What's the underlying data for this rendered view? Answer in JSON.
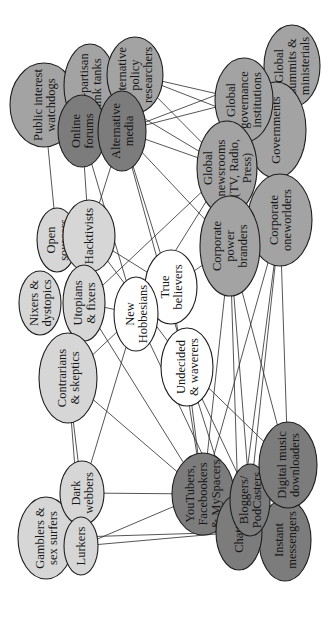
{
  "diagram": {
    "title": "",
    "orientation": "rotated-90-ccw",
    "colors": {
      "white": "#ffffff",
      "light": "#d6d6d6",
      "medium": "#a3a3a3",
      "dark": "#7c7c7c",
      "stroke": "#1e1e1e"
    },
    "nodes": [
      {
        "id": "public-interest-watchdogs",
        "lines": [
          "Public interest",
          "watchdogs"
        ],
        "cx": 44,
        "cy": 105,
        "rx": 34,
        "ry": 42,
        "shade": "medium"
      },
      {
        "id": "non-partisan-think-tanks",
        "lines": [
          "Non-partisan",
          "think tanks"
        ],
        "cx": 90,
        "cy": 86,
        "rx": 26,
        "ry": 42,
        "shade": "medium"
      },
      {
        "id": "online-forums",
        "lines": [
          "Online",
          "forums"
        ],
        "cx": 82,
        "cy": 131,
        "rx": 24,
        "ry": 36,
        "shade": "dark"
      },
      {
        "id": "alternative-policy-researchers",
        "lines": [
          "Alternative",
          "policy",
          "researchers"
        ],
        "cx": 135,
        "cy": 75,
        "rx": 28,
        "ry": 38,
        "shade": "medium"
      },
      {
        "id": "alternative-media",
        "lines": [
          "Alternative",
          "media"
        ],
        "cx": 122,
        "cy": 131,
        "rx": 24,
        "ry": 40,
        "shade": "dark"
      },
      {
        "id": "global-summits-ministerials",
        "lines": [
          "Global",
          "summits &",
          "ministerials"
        ],
        "cx": 292,
        "cy": 66,
        "rx": 28,
        "ry": 41,
        "shade": "medium"
      },
      {
        "id": "governments",
        "lines": [
          "Governments"
        ],
        "cx": 276,
        "cy": 130,
        "rx": 30,
        "ry": 48,
        "shade": "medium"
      },
      {
        "id": "global-governance-institutions",
        "lines": [
          "Global",
          "governance",
          "institutions"
        ],
        "cx": 244,
        "cy": 100,
        "rx": 29,
        "ry": 42,
        "shade": "medium"
      },
      {
        "id": "global-newsrooms",
        "lines": [
          "Global",
          "newsrooms",
          "(TV, Radio,",
          "Press)"
        ],
        "cx": 227,
        "cy": 168,
        "rx": 30,
        "ry": 47,
        "shade": "medium"
      },
      {
        "id": "corporate-oneworlders",
        "lines": [
          "Corporate",
          "oneworlders"
        ],
        "cx": 280,
        "cy": 220,
        "rx": 32,
        "ry": 46,
        "shade": "medium"
      },
      {
        "id": "corporate-power-branders",
        "lines": [
          "Corporate",
          "power",
          "branders"
        ],
        "cx": 230,
        "cy": 246,
        "rx": 30,
        "ry": 50,
        "shade": "medium"
      },
      {
        "id": "open-sourcers",
        "lines": [
          "Open",
          "sourcers"
        ],
        "cx": 57,
        "cy": 240,
        "rx": 20,
        "ry": 32,
        "shade": "light"
      },
      {
        "id": "hacktivists",
        "lines": [
          "Hacktivists"
        ],
        "cx": 89,
        "cy": 236,
        "rx": 26,
        "ry": 36,
        "shade": "light"
      },
      {
        "id": "nixers-dystopics",
        "lines": [
          "Nixers &",
          "dystopics"
        ],
        "cx": 40,
        "cy": 303,
        "rx": 21,
        "ry": 32,
        "shade": "light"
      },
      {
        "id": "utopians-fixers",
        "lines": [
          "Utopians",
          "& fixers"
        ],
        "cx": 84,
        "cy": 303,
        "rx": 21,
        "ry": 38,
        "shade": "light"
      },
      {
        "id": "contrarians-skeptics",
        "lines": [
          "Contrarians",
          "& skeptics"
        ],
        "cx": 68,
        "cy": 378,
        "rx": 29,
        "ry": 45,
        "shade": "light"
      },
      {
        "id": "true-believers",
        "lines": [
          "True",
          "believers"
        ],
        "cx": 171,
        "cy": 287,
        "rx": 26,
        "ry": 37,
        "shade": "white"
      },
      {
        "id": "new-hobbesians",
        "lines": [
          "New",
          "Hobbesians"
        ],
        "cx": 136,
        "cy": 314,
        "rx": 22,
        "ry": 37,
        "shade": "white"
      },
      {
        "id": "undecided-waverers",
        "lines": [
          "Undecided",
          "& waverers"
        ],
        "cx": 187,
        "cy": 367,
        "rx": 26,
        "ry": 39,
        "shade": "white"
      },
      {
        "id": "gamblers-sex-surfers",
        "lines": [
          "Gamblers &",
          "sex surfers"
        ],
        "cx": 46,
        "cy": 538,
        "rx": 28,
        "ry": 41,
        "shade": "light"
      },
      {
        "id": "dark-webbers",
        "lines": [
          "Dark",
          "webbers"
        ],
        "cx": 82,
        "cy": 493,
        "rx": 22,
        "ry": 32,
        "shade": "light"
      },
      {
        "id": "lurkers",
        "lines": [
          "Lurkers"
        ],
        "cx": 81,
        "cy": 546,
        "rx": 17,
        "ry": 29,
        "shade": "light"
      },
      {
        "id": "youtubers",
        "lines": [
          "YouTubers,",
          "Facebookers",
          "& MySpacers"
        ],
        "cx": 203,
        "cy": 494,
        "rx": 31,
        "ry": 41,
        "shade": "dark"
      },
      {
        "id": "instant-messengers",
        "lines": [
          "Instant",
          "messengers"
        ],
        "cx": 285,
        "cy": 540,
        "rx": 26,
        "ry": 41,
        "shade": "dark"
      },
      {
        "id": "chatters",
        "lines": [
          "Chatters"
        ],
        "cx": 239,
        "cy": 532,
        "rx": 23,
        "ry": 38,
        "shade": "dark"
      },
      {
        "id": "bloggers-podcasters",
        "lines": [
          "Bloggers/",
          "PodCasters"
        ],
        "cx": 250,
        "cy": 500,
        "rx": 20,
        "ry": 36,
        "shade": "dark"
      },
      {
        "id": "digital-music-downloaders",
        "lines": [
          "Digital music",
          "downloaders"
        ],
        "cx": 288,
        "cy": 465,
        "rx": 29,
        "ry": 43,
        "shade": "dark"
      }
    ],
    "edges": [
      [
        "alternative-policy-researchers",
        "global-governance-institutions"
      ],
      [
        "alternative-policy-researchers",
        "global-newsrooms"
      ],
      [
        "alternative-policy-researchers",
        "governments"
      ],
      [
        "alternative-media",
        "global-governance-institutions"
      ],
      [
        "alternative-media",
        "global-newsrooms"
      ],
      [
        "alternative-media",
        "global-summits-ministerials"
      ],
      [
        "alternative-media",
        "corporate-power-branders"
      ],
      [
        "alternative-media",
        "undecided-waverers"
      ],
      [
        "alternative-media",
        "true-believers"
      ],
      [
        "alternative-media",
        "hacktivists"
      ],
      [
        "online-forums",
        "hacktivists"
      ],
      [
        "online-forums",
        "new-hobbesians"
      ],
      [
        "public-interest-watchdogs",
        "open-sourcers"
      ],
      [
        "non-partisan-think-tanks",
        "global-newsrooms"
      ],
      [
        "global-newsrooms",
        "utopians-fixers"
      ],
      [
        "global-newsrooms",
        "new-hobbesians"
      ],
      [
        "hacktivists",
        "true-believers"
      ],
      [
        "hacktivists",
        "undecided-waverers"
      ],
      [
        "true-believers",
        "corporate-power-branders"
      ],
      [
        "true-believers",
        "youtubers"
      ],
      [
        "utopians-fixers",
        "youtubers"
      ],
      [
        "utopians-fixers",
        "new-hobbesians"
      ],
      [
        "contrarians-skeptics",
        "youtubers"
      ],
      [
        "contrarians-skeptics",
        "new-hobbesians"
      ],
      [
        "contrarians-skeptics",
        "lurkers"
      ],
      [
        "contrarians-skeptics",
        "dark-webbers"
      ],
      [
        "new-hobbesians",
        "dark-webbers"
      ],
      [
        "new-hobbesians",
        "chatters"
      ],
      [
        "undecided-waverers",
        "chatters"
      ],
      [
        "undecided-waverers",
        "bloggers-podcasters"
      ],
      [
        "undecided-waverers",
        "youtubers"
      ],
      [
        "undecided-waverers",
        "digital-music-downloaders"
      ],
      [
        "corporate-power-branders",
        "youtubers"
      ],
      [
        "corporate-power-branders",
        "bloggers-podcasters"
      ],
      [
        "corporate-power-branders",
        "chatters"
      ],
      [
        "corporate-power-branders",
        "digital-music-downloaders"
      ],
      [
        "corporate-oneworlders",
        "digital-music-downloaders"
      ],
      [
        "corporate-oneworlders",
        "bloggers-podcasters"
      ],
      [
        "corporate-oneworlders",
        "youtubers"
      ],
      [
        "corporate-oneworlders",
        "chatters"
      ],
      [
        "dark-webbers",
        "youtubers"
      ],
      [
        "lurkers",
        "youtubers"
      ],
      [
        "lurkers",
        "chatters"
      ],
      [
        "gamblers-sex-surfers",
        "chatters"
      ]
    ]
  }
}
